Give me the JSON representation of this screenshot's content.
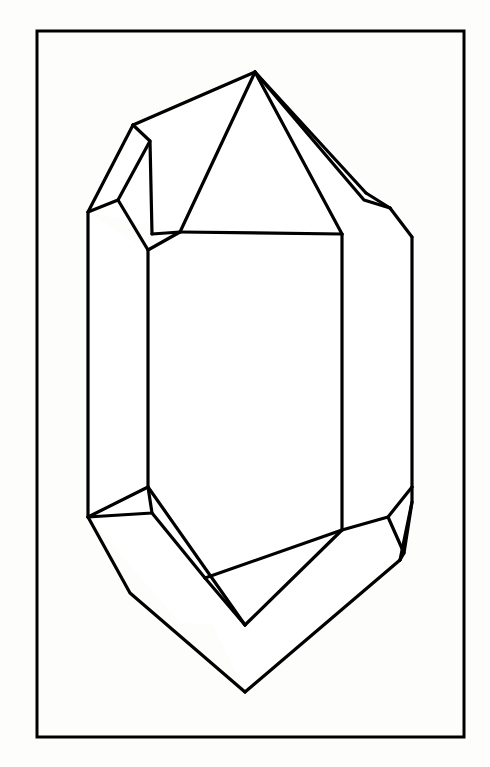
{
  "figure": {
    "title": "Crystal habit line drawing",
    "caption": "",
    "background_color": "#fdfdfc",
    "line_color": "#000000",
    "face_fill_color": "#ffffff"
  },
  "frame": {
    "name": "figure-border",
    "x": 37,
    "y": 31,
    "width": 427,
    "height": 706,
    "stroke_color": "#000000",
    "stroke_width": 3
  },
  "drawing": {
    "stroke_width": 3.2,
    "thin_stroke_width": 2.6,
    "viewbox": "0 0 490 767",
    "faces": [
      {
        "name": "front-prism-face",
        "points": "148,250 180,232 342,234 342,530 245,625 148,487"
      },
      {
        "name": "left-prism-face",
        "points": "88,212 148,250 148,487 88,517"
      },
      {
        "name": "right-prism-face",
        "points": "342,234 390,208 412,237 412,487 342,530"
      },
      {
        "name": "top-front-pyramid-face",
        "points": "180,232 255,72 342,234"
      },
      {
        "name": "top-left-pyramid-face",
        "points": "88,212 133,125 255,72 180,232"
      },
      {
        "name": "top-left-sliver-face",
        "points": "88,212 133,125 150,141 118,200"
      },
      {
        "name": "top-right-pyramid-face",
        "points": "342,234 255,72 390,208"
      },
      {
        "name": "top-right-sliver-face",
        "points": "366,193 390,208 364,200"
      },
      {
        "name": "bottom-front-pyramid-face",
        "points": "148,487 245,625 342,530 245,692"
      },
      {
        "name": "bottom-left-face",
        "points": "88,517 148,487 245,625 180,623"
      },
      {
        "name": "bottom-left-triangle-face",
        "points": "88,517 148,487 152,513"
      },
      {
        "name": "bottom-right-face",
        "points": "342,530 412,487 400,560 245,692"
      },
      {
        "name": "bottom-right-sliver-face",
        "points": "388,517 412,487 404,553"
      }
    ],
    "edges": [
      {
        "name": "top-apex-to-upper-left-shoulder",
        "d": "M 255 72 L 133 125"
      },
      {
        "name": "upper-left-shoulder-to-left-corner",
        "d": "M 133 125 L 88 212"
      },
      {
        "name": "top-apex-to-front-left-shoulder",
        "d": "M 255 72 L 180 232"
      },
      {
        "name": "top-apex-to-front-right-shoulder",
        "d": "M 255 72 L 342 234"
      },
      {
        "name": "top-apex-to-upper-right-shoulder",
        "d": "M 255 72 L 366 193"
      },
      {
        "name": "upper-right-shoulder-to-right-corner",
        "d": "M 366 193 L 390 208"
      },
      {
        "name": "upper-right-inner-sliver",
        "d": "M 255 72 L 364 200 L 390 208"
      },
      {
        "name": "upper-left-sliver-inner",
        "d": "M 133 125 L 150 141 L 118 200 L 88 212"
      },
      {
        "name": "upper-left-sliver-face-edge",
        "d": "M 150 141 L 152 234"
      },
      {
        "name": "left-facet-vertical-inner",
        "d": "M 118 200 L 148 250"
      },
      {
        "name": "front-top-edge",
        "d": "M 180 232 L 342 234"
      },
      {
        "name": "front-left-shoulder-to-front-left-edge",
        "d": "M 180 232 L 148 250"
      },
      {
        "name": "front-face-left-vertical",
        "d": "M 148 250 L 148 487"
      },
      {
        "name": "front-face-right-vertical",
        "d": "M 342 234 L 342 530"
      },
      {
        "name": "left-outer-vertical",
        "d": "M 88 212 L 88 517"
      },
      {
        "name": "right-outer-vertical",
        "d": "M 412 237 L 412 487"
      },
      {
        "name": "right-corner-to-right-outer",
        "d": "M 390 208 L 412 237"
      },
      {
        "name": "left-facet-top-divider",
        "d": "M 152 234 L 180 232"
      },
      {
        "name": "bottom-left-corner-divider",
        "d": "M 148 487 L 88 517"
      },
      {
        "name": "bottom-left-triangle-edge",
        "d": "M 148 487 L 152 513 L 88 517"
      },
      {
        "name": "bottom-left-inner-band",
        "d": "M 152 513 L 205 578"
      },
      {
        "name": "bottom-left-band-lower",
        "d": "M 148 487 L 245 625"
      },
      {
        "name": "bottom-inner-v-left",
        "d": "M 205 578 L 245 625"
      },
      {
        "name": "bottom-inner-v-right",
        "d": "M 245 625 L 342 530"
      },
      {
        "name": "bottom-inner-top-edge",
        "d": "M 205 578 L 342 530"
      },
      {
        "name": "bottom-left-outer-slope",
        "d": "M 88 517 L 130 593 L 245 692"
      },
      {
        "name": "bottom-point-to-right",
        "d": "M 245 692 L 400 560"
      },
      {
        "name": "bottom-right-upper-slope",
        "d": "M 342 530 L 388 517 L 412 487"
      },
      {
        "name": "bottom-right-sliver-inner",
        "d": "M 388 517 L 404 553 L 400 560"
      },
      {
        "name": "bottom-right-sliver-outer",
        "d": "M 412 487 L 412 502 L 400 560"
      },
      {
        "name": "bottom-right-corner-join",
        "d": "M 404 553 L 412 502"
      }
    ]
  }
}
